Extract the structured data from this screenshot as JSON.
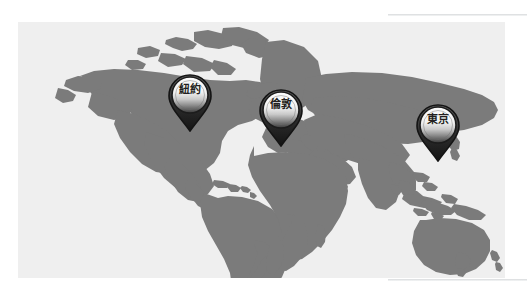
{
  "panel": {
    "name": "world-map-panel",
    "background_color": "#efefef",
    "land_color": "#7b7b7b",
    "width": 487,
    "height": 256
  },
  "decorations": {
    "top_rule_color": "#d8dadc",
    "bottom_rule_color": "#d8dadc"
  },
  "map": {
    "title": "",
    "pins": [
      {
        "id": "pin-new-york",
        "label": "紐約",
        "x": 172,
        "y": 110,
        "icon": "map-pin-icon",
        "head_color": "#e8e8e8",
        "tail_color": "#2b2b2b",
        "outline_color": "#1c1c1c"
      },
      {
        "id": "pin-london",
        "label": "倫敦",
        "x": 263,
        "y": 125,
        "icon": "map-pin-icon",
        "head_color": "#e8e8e8",
        "tail_color": "#2b2b2b",
        "outline_color": "#1c1c1c"
      },
      {
        "id": "pin-tokyo",
        "label": "東京",
        "x": 420,
        "y": 140,
        "icon": "map-pin-icon",
        "head_color": "#e8e8e8",
        "tail_color": "#2b2b2b",
        "outline_color": "#1c1c1c"
      }
    ]
  }
}
